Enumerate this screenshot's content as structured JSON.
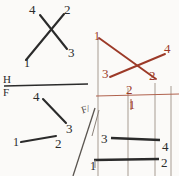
{
  "sheet": {
    "title": "descriptive-geometry-sketch",
    "background_color": "#fbfaf8",
    "ink_black": "#2b2b2b",
    "ink_red": "#9c3a28",
    "ink_gray": "#8a8179"
  },
  "fold_lines": {
    "hf_label_top": "H",
    "hf_label_bottom": "F",
    "hf_divider_present": true,
    "diagonal_label": "F/",
    "diagonal_label_full": "F/H"
  },
  "views": {
    "top_left": {
      "name": "horizontal-view-crossed-lines",
      "color": "#2b2b2b",
      "points": [
        {
          "id": "1",
          "label": "1",
          "x": 24,
          "y": 63
        },
        {
          "id": "2",
          "label": "2",
          "x": 66,
          "y": 9
        },
        {
          "id": "3",
          "label": "3",
          "x": 70,
          "y": 52
        },
        {
          "id": "4",
          "label": "4",
          "x": 33,
          "y": 9
        }
      ],
      "segments": [
        {
          "from": "1",
          "to": "2",
          "note": "long-diagonal-lower-left-to-upper-right"
        },
        {
          "from": "4",
          "to": "3",
          "note": "short-diagonal-upper-left-to-lower-right"
        }
      ]
    },
    "bottom_left": {
      "name": "frontal-view-two-lines",
      "color": "#2b2b2b",
      "points": [
        {
          "id": "4",
          "label": "4",
          "x": 36,
          "y": 96
        },
        {
          "id": "3",
          "label": "3",
          "x": 69,
          "y": 128
        },
        {
          "id": "1",
          "label": "1",
          "x": 16,
          "y": 143
        },
        {
          "id": "2",
          "label": "2",
          "x": 58,
          "y": 143
        }
      ],
      "segments": [
        {
          "from": "4",
          "to": "3",
          "note": "descending-diagonal"
        },
        {
          "from": "1",
          "to": "2",
          "note": "near-horizontal"
        }
      ]
    },
    "top_right": {
      "name": "auxiliary-view-crossed-lines",
      "color": "#9c3a28",
      "points": [
        {
          "id": "1",
          "label": "1",
          "x": 95,
          "y": 36
        },
        {
          "id": "4",
          "label": "4",
          "x": 167,
          "y": 49
        },
        {
          "id": "3",
          "label": "3",
          "x": 107,
          "y": 73
        },
        {
          "id": "2",
          "label": "2",
          "x": 152,
          "y": 75
        }
      ],
      "segments": [
        {
          "from": "1",
          "to": "2",
          "note": "upper-left-to-lower-right"
        },
        {
          "from": "3",
          "to": "4",
          "note": "lower-left-to-upper-right"
        }
      ]
    },
    "bottom_right": {
      "name": "second-auxiliary-view",
      "red_label": "2",
      "red_tick_label": "1",
      "points": [
        {
          "id": "3",
          "label": "3",
          "x": 104,
          "y": 140
        },
        {
          "id": "4",
          "label": "4",
          "x": 164,
          "y": 147
        },
        {
          "id": "1",
          "label": "1",
          "x": 92,
          "y": 162
        },
        {
          "id": "2",
          "label": "2",
          "x": 163,
          "y": 162
        }
      ],
      "segments": [
        {
          "from": "3",
          "to": "4",
          "color": "#2b2b2b",
          "note": "horizontal-upper"
        },
        {
          "from": "1",
          "to": "2",
          "color": "#2b2b2b",
          "note": "horizontal-lower"
        }
      ]
    }
  },
  "projectors": {
    "vertical_count": 4,
    "horizontal_red_rule": true
  }
}
